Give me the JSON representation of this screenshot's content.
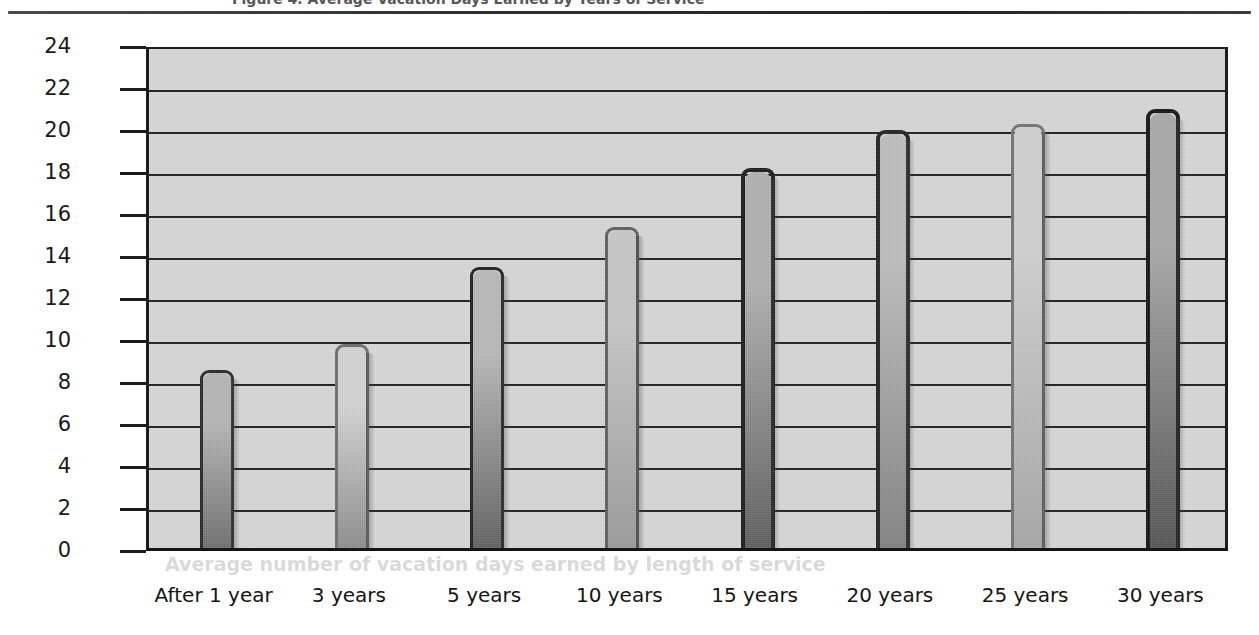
{
  "document": {
    "clipped_caption": "Figure 4.  Average Vacation Days Earned by Years of Service",
    "ghost_text": "Average number of vacation days earned by length of service"
  },
  "chart_data": {
    "type": "bar",
    "title": "",
    "xlabel": "",
    "ylabel": "Average Number of Days Earned",
    "categories": [
      "After 1 year",
      "3 years",
      "5 years",
      "10 years",
      "15 years",
      "20 years",
      "25 years",
      "30 years"
    ],
    "values": [
      8.5,
      9.7,
      13.4,
      15.3,
      18.1,
      19.9,
      20.2,
      20.9
    ],
    "ylim": [
      0,
      24
    ],
    "ytick_step": 2,
    "yticks": [
      "0",
      "2",
      "4",
      "6",
      "8",
      "10",
      "12",
      "14",
      "16",
      "18",
      "20",
      "22",
      "24"
    ],
    "grid": true,
    "grid_axis": "y",
    "legend": "none",
    "plot_background": "#d6d6d6",
    "bar_styles": [
      {
        "top": "#b4b4b4",
        "bottom": "#6f6f6f",
        "outline": "#2a2a2a",
        "outline_width": 3
      },
      {
        "top": "#d2d2d2",
        "bottom": "#8d8d8d",
        "outline": "#6e6e6e",
        "outline_width": 3
      },
      {
        "top": "#b8b8b8",
        "bottom": "#626262",
        "outline": "#1f1f1f",
        "outline_width": 3
      },
      {
        "top": "#c6c6c6",
        "bottom": "#9a9a9a",
        "outline": "#5e5e5e",
        "outline_width": 3
      },
      {
        "top": "#b0b0b0",
        "bottom": "#5f5f5f",
        "outline": "#1c1c1c",
        "outline_width": 4
      },
      {
        "top": "#bdbdbd",
        "bottom": "#828282",
        "outline": "#232323",
        "outline_width": 4
      },
      {
        "top": "#cfcfcf",
        "bottom": "#a6a6a6",
        "outline": "#737373",
        "outline_width": 3
      },
      {
        "top": "#a8a8a8",
        "bottom": "#555555",
        "outline": "#151515",
        "outline_width": 4
      }
    ]
  }
}
